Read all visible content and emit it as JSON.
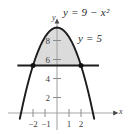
{
  "figure": {
    "curve_label": "y = 9 − x²",
    "line_label": "y = 5",
    "x_axis_name": "x",
    "y_axis_name": "y"
  },
  "chart_data": {
    "type": "line",
    "title": "",
    "xlabel": "x",
    "ylabel": "y",
    "xlim": [
      -3.1,
      3.1
    ],
    "ylim": [
      -1.2,
      10.2
    ],
    "grid": false,
    "legend": "inline-annotations",
    "x_ticks": [
      -2,
      -1,
      1,
      2
    ],
    "x_tick_labels": [
      "−2",
      "−1",
      "1",
      "2"
    ],
    "y_ticks": [
      2,
      4,
      6,
      8
    ],
    "y_tick_labels": [
      "2",
      "4",
      "6",
      "8"
    ],
    "series": [
      {
        "name": "y = 9 − x²",
        "type": "parabola",
        "equation": "y = 9 - x^2",
        "vertex": [
          0,
          9
        ],
        "opens": "down",
        "color": "#1a1a1a",
        "x": [
          -3.1,
          -2.8,
          -2.6,
          -2.4,
          -2.2,
          -2.0,
          -1.8,
          -1.6,
          -1.4,
          -1.2,
          -1.0,
          -0.8,
          -0.6,
          -0.4,
          -0.2,
          0.0,
          0.2,
          0.4,
          0.6,
          0.8,
          1.0,
          1.2,
          1.4,
          1.6,
          1.8,
          2.0,
          2.2,
          2.4,
          2.6,
          2.8,
          3.1
        ],
        "values": [
          -0.61,
          1.16,
          2.24,
          3.24,
          4.16,
          5.0,
          5.76,
          6.44,
          7.04,
          7.56,
          8.0,
          8.36,
          8.64,
          8.84,
          8.96,
          9.0,
          8.96,
          8.84,
          8.64,
          8.36,
          8.0,
          7.56,
          7.04,
          6.44,
          5.76,
          5.0,
          4.16,
          3.24,
          2.24,
          1.16,
          -0.61
        ]
      },
      {
        "name": "y = 5",
        "type": "horizontal-line",
        "equation": "y = 5",
        "value": 5,
        "color": "#1a1a1a",
        "x_extent": [
          -3.3,
          3.5
        ]
      }
    ],
    "intersections": [
      {
        "x": -2,
        "y": 5,
        "marker": "filled-dot"
      },
      {
        "x": 2,
        "y": 5,
        "marker": "filled-dot"
      }
    ],
    "shaded_region": {
      "label": "region between y = 5 and y = 9 − x²",
      "between": [
        "y = 5",
        "y = 9 − x²"
      ],
      "x_range": [
        -2,
        2
      ],
      "fill": "#d9d9d9"
    },
    "colors": {
      "curve": "#1a1a1a",
      "line": "#1a1a1a",
      "axis": "#9a9a9a",
      "shade": "#d9d9d9",
      "background": "#ffffff"
    }
  }
}
